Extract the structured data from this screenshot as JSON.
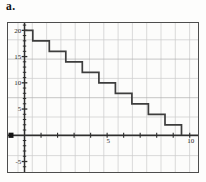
{
  "part_label": "a.",
  "chart_data": {
    "type": "line",
    "subtype": "step-staircase",
    "title": "",
    "xlabel": "",
    "ylabel": "",
    "x_axis": {
      "range": [
        -1,
        10.5
      ],
      "tick_step": 1,
      "labeled_ticks": [
        5,
        10
      ]
    },
    "y_axis": {
      "range": [
        -7,
        21.4
      ],
      "tick_step": 1,
      "labeled_ticks": [
        20,
        15,
        10,
        5,
        -5
      ]
    },
    "grid": true,
    "legend": "none",
    "series": [
      {
        "name": "staircase",
        "color": "#3d3d3d",
        "points": [
          [
            0,
            20
          ],
          [
            0.5,
            20
          ],
          [
            0.5,
            18
          ],
          [
            1.5,
            18
          ],
          [
            1.5,
            16
          ],
          [
            2.5,
            16
          ],
          [
            2.5,
            14
          ],
          [
            3.5,
            14
          ],
          [
            3.5,
            12
          ],
          [
            4.5,
            12
          ],
          [
            4.5,
            10
          ],
          [
            5.5,
            10
          ],
          [
            5.5,
            8
          ],
          [
            6.5,
            8
          ],
          [
            6.5,
            6
          ],
          [
            7.5,
            6
          ],
          [
            7.5,
            4
          ],
          [
            8.5,
            4
          ],
          [
            8.5,
            2
          ],
          [
            9.5,
            2
          ],
          [
            9.5,
            0
          ]
        ]
      }
    ],
    "origin_marker": {
      "shape": "filled-square",
      "position_y": 0,
      "at_plot_left_edge": true
    },
    "colors": {
      "axis": "#2e2e2e",
      "grid": "#cbcbcb",
      "grid_major": "#adadad",
      "line": "#3d3d3d",
      "label": "#2a2a2a",
      "frame": "#4d4d4d",
      "marker": "#141414"
    }
  }
}
